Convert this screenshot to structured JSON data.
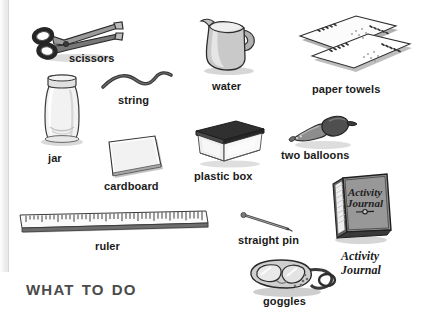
{
  "page": {
    "section_title": "What to Do",
    "background_color": "#ffffff",
    "ink_color": "#1a1a1a"
  },
  "materials": [
    {
      "id": "scissors",
      "label": "scissors",
      "icon": "scissors-icon"
    },
    {
      "id": "string",
      "label": "string",
      "icon": "string-icon"
    },
    {
      "id": "water",
      "label": "water",
      "icon": "pitcher-icon"
    },
    {
      "id": "paper-towels",
      "label": "paper towels",
      "icon": "paper-towels-icon"
    },
    {
      "id": "jar",
      "label": "jar",
      "icon": "jar-icon"
    },
    {
      "id": "cardboard",
      "label": "cardboard",
      "icon": "cardboard-icon"
    },
    {
      "id": "plastic-box",
      "label": "plastic box",
      "icon": "plastic-box-icon"
    },
    {
      "id": "two-balloons",
      "label": "two balloons",
      "icon": "balloons-icon"
    },
    {
      "id": "ruler",
      "label": "ruler",
      "icon": "ruler-icon"
    },
    {
      "id": "straight-pin",
      "label": "straight pin",
      "icon": "straight-pin-icon"
    },
    {
      "id": "goggles",
      "label": "goggles",
      "icon": "goggles-icon"
    },
    {
      "id": "activity-journal",
      "label": "Activity\nJournal",
      "icon": "journal-icon"
    }
  ],
  "journal": {
    "caption_line1": "Activity",
    "caption_line2": "Journal",
    "cover_line1": "Activity",
    "cover_line2": "Journal"
  }
}
